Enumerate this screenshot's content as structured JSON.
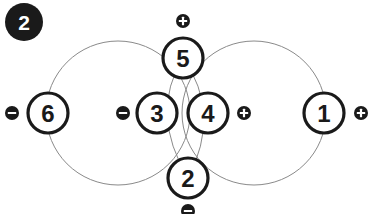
{
  "diagram": {
    "type": "node-link-diagram",
    "canvas": {
      "width": 375,
      "height": 214,
      "background": "#ffffff"
    },
    "colors": {
      "stroke_node": "#1a1a1a",
      "stroke_path": "#8a8a8a",
      "fill_node": "#ffffff",
      "fill_badge": "#1a1a1a",
      "badge_glyph": "#ffffff",
      "step_fill": "#1a1a1a",
      "step_text": "#ffffff"
    }
  },
  "step_marker": {
    "label": "2",
    "name": "step-number",
    "cx": 24,
    "cy": 22,
    "r": 19
  },
  "paths": [
    {
      "name": "left-large-circle",
      "shape": "circle",
      "cx": 118,
      "cy": 113,
      "r": 72
    },
    {
      "name": "right-large-circle",
      "shape": "circle",
      "cx": 254,
      "cy": 113,
      "r": 72
    },
    {
      "name": "lens-left-arc",
      "shape": "arc",
      "d": "M 183 58 Q 149 113 188 178"
    },
    {
      "name": "lens-right-arc",
      "shape": "arc",
      "d": "M 183 58 Q 222 113 188 178"
    }
  ],
  "nodes": [
    {
      "id": "node-6",
      "label": "6",
      "cx": 48,
      "cy": 113,
      "r": 20
    },
    {
      "id": "node-3",
      "label": "3",
      "cx": 157,
      "cy": 113,
      "r": 20
    },
    {
      "id": "node-4",
      "label": "4",
      "cx": 208,
      "cy": 113,
      "r": 20
    },
    {
      "id": "node-1",
      "label": "1",
      "cx": 324,
      "cy": 113,
      "r": 20
    },
    {
      "id": "node-5",
      "label": "5",
      "cx": 183,
      "cy": 58,
      "r": 20
    },
    {
      "id": "node-2",
      "label": "2",
      "cx": 188,
      "cy": 178,
      "r": 20
    }
  ],
  "badges": [
    {
      "id": "badge-minus-far-left",
      "sign": "minus",
      "glyph": "−",
      "cx": 12,
      "cy": 113,
      "r": 7
    },
    {
      "id": "badge-minus-center",
      "sign": "minus",
      "glyph": "−",
      "cx": 123,
      "cy": 113,
      "r": 7
    },
    {
      "id": "badge-plus-center",
      "sign": "plus",
      "glyph": "+",
      "cx": 244,
      "cy": 113,
      "r": 7
    },
    {
      "id": "badge-plus-far-right",
      "sign": "plus",
      "glyph": "+",
      "cx": 361,
      "cy": 113,
      "r": 7
    },
    {
      "id": "badge-plus-top",
      "sign": "plus",
      "glyph": "+",
      "cx": 183,
      "cy": 21,
      "r": 7
    },
    {
      "id": "badge-minus-bottom",
      "sign": "minus",
      "glyph": "−",
      "cx": 188,
      "cy": 211,
      "r": 7
    }
  ]
}
